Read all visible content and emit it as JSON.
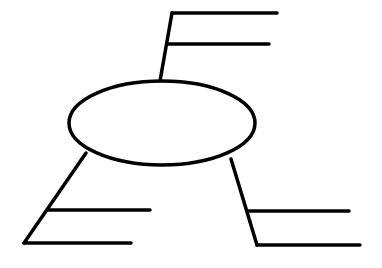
{
  "diagram": {
    "type": "graphic-organizer",
    "stroke_color": "#000000",
    "background": "#ffffff",
    "center": {
      "label": "",
      "cx": 162,
      "cy": 123,
      "rx": 93,
      "ry": 42
    },
    "branches": [
      {
        "id": "top",
        "lines": [
          "",
          ""
        ]
      },
      {
        "id": "bottom-left",
        "lines": [
          "",
          ""
        ]
      },
      {
        "id": "bottom-right",
        "lines": [
          "",
          ""
        ]
      }
    ]
  }
}
